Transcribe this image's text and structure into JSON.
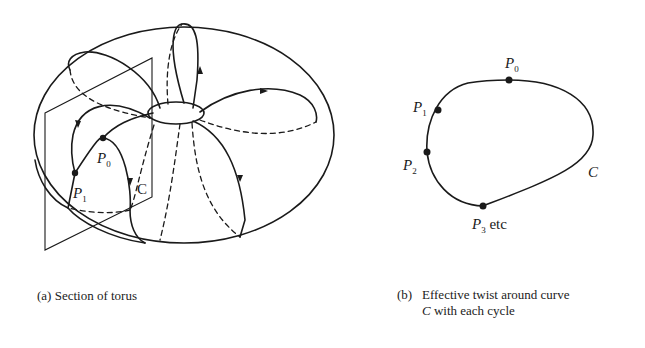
{
  "figure_a": {
    "labels": {
      "p0": "P",
      "p0_sub": "0",
      "p1": "P",
      "p1_sub": "1",
      "c": "C"
    },
    "caption": "(a) Section of torus"
  },
  "figure_b": {
    "labels": {
      "p0": "P",
      "p0_sub": "0",
      "p1": "P",
      "p1_sub": "1",
      "p2": "P",
      "p2_sub": "2",
      "p3": "P",
      "p3_sub": "3",
      "p3_suffix": " etc",
      "c": "C"
    },
    "caption_tag": "(b)",
    "caption_line1": "Effective twist around curve",
    "caption_line2_italic": "C",
    "caption_line2_rest": " with each cycle"
  },
  "colors": {
    "ink": "#1a1a1a",
    "background": "#ffffff"
  }
}
